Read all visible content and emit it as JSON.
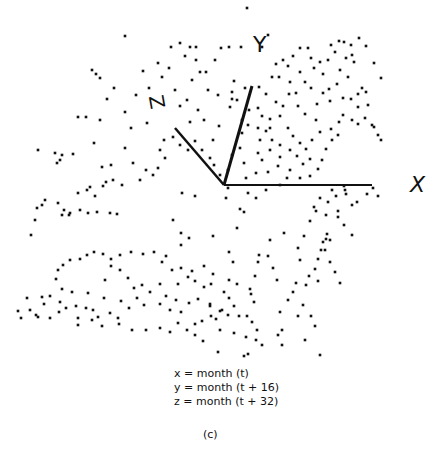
{
  "figure": {
    "axis_labels": {
      "x": "X",
      "y": "Y",
      "z": "Z"
    },
    "captions": [
      "x = month (t)",
      "y = month (t + 16)",
      "z = month (t + 32)"
    ],
    "sub_label": "(c)",
    "origin": [
      224,
      185
    ],
    "axes": {
      "x_end": [
        372,
        185
      ],
      "y_end": [
        252,
        86
      ],
      "z_end": [
        175,
        128
      ]
    }
  },
  "chart_data": {
    "type": "scatter",
    "title": "",
    "xlabel": "x = month (t)",
    "ylabel": "y = month (t + 16)",
    "zlabel": "z = month (t + 32)",
    "points_px": [
      [
        247,
        8
      ],
      [
        125,
        36
      ],
      [
        180,
        43
      ],
      [
        190,
        47
      ],
      [
        196,
        47
      ],
      [
        221,
        48
      ],
      [
        171,
        47
      ],
      [
        229,
        47
      ],
      [
        241,
        47
      ],
      [
        262,
        47
      ],
      [
        268,
        35
      ],
      [
        92,
        70
      ],
      [
        162,
        77
      ],
      [
        169,
        68
      ],
      [
        185,
        56
      ],
      [
        196,
        60
      ],
      [
        215,
        60
      ],
      [
        206,
        72
      ],
      [
        175,
        90
      ],
      [
        107,
        99
      ],
      [
        187,
        100
      ],
      [
        232,
        99
      ],
      [
        78,
        117
      ],
      [
        86,
        117
      ],
      [
        100,
        120
      ],
      [
        147,
        123
      ],
      [
        125,
        148
      ],
      [
        160,
        150
      ],
      [
        131,
        128
      ],
      [
        164,
        140
      ],
      [
        111,
        165
      ],
      [
        102,
        167
      ],
      [
        133,
        163
      ],
      [
        146,
        170
      ],
      [
        106,
        182
      ],
      [
        182,
        193
      ],
      [
        195,
        196
      ],
      [
        228,
        188
      ],
      [
        226,
        198
      ],
      [
        248,
        193
      ],
      [
        256,
        198
      ],
      [
        240,
        209
      ],
      [
        244,
        212
      ],
      [
        173,
        220
      ],
      [
        181,
        233
      ],
      [
        189,
        238
      ],
      [
        181,
        245
      ],
      [
        213,
        236
      ],
      [
        237,
        228
      ],
      [
        229,
        252
      ],
      [
        204,
        266
      ],
      [
        213,
        274
      ],
      [
        233,
        262
      ],
      [
        258,
        262
      ],
      [
        255,
        276
      ],
      [
        229,
        280
      ],
      [
        224,
        292
      ],
      [
        210,
        306
      ],
      [
        216,
        319
      ],
      [
        220,
        330
      ],
      [
        254,
        302
      ],
      [
        218,
        352
      ],
      [
        234,
        333
      ],
      [
        239,
        316
      ],
      [
        251,
        294
      ],
      [
        237,
        284
      ],
      [
        259,
        255
      ],
      [
        270,
        240
      ],
      [
        284,
        233
      ],
      [
        268,
        256
      ],
      [
        273,
        268
      ],
      [
        277,
        280
      ],
      [
        250,
        289
      ],
      [
        234,
        306
      ],
      [
        229,
        298
      ],
      [
        222,
        310
      ],
      [
        228,
        315
      ],
      [
        247,
        316
      ],
      [
        252,
        322
      ],
      [
        246,
        337
      ],
      [
        257,
        330
      ],
      [
        280,
        312
      ],
      [
        282,
        345
      ],
      [
        278,
        335
      ],
      [
        282,
        330
      ],
      [
        288,
        300
      ],
      [
        293,
        292
      ],
      [
        309,
        276
      ],
      [
        306,
        285
      ],
      [
        300,
        260
      ],
      [
        298,
        248
      ],
      [
        304,
        236
      ],
      [
        310,
        221
      ],
      [
        316,
        211
      ],
      [
        326,
        215
      ],
      [
        338,
        211
      ],
      [
        328,
        202
      ],
      [
        336,
        196
      ],
      [
        344,
        186
      ],
      [
        346,
        194
      ],
      [
        332,
        190
      ],
      [
        320,
        198
      ],
      [
        314,
        207
      ],
      [
        327,
        234
      ],
      [
        323,
        242
      ],
      [
        321,
        250
      ],
      [
        318,
        259
      ],
      [
        315,
        269
      ],
      [
        318,
        281
      ],
      [
        338,
        217
      ],
      [
        344,
        225
      ],
      [
        352,
        235
      ],
      [
        330,
        240
      ],
      [
        345,
        190
      ],
      [
        352,
        205
      ],
      [
        357,
        202
      ],
      [
        367,
        194
      ],
      [
        373,
        188
      ],
      [
        378,
        196
      ],
      [
        326,
        239
      ],
      [
        325,
        250
      ],
      [
        330,
        262
      ],
      [
        335,
        272
      ],
      [
        340,
        283
      ],
      [
        296,
        283
      ],
      [
        303,
        305
      ],
      [
        311,
        316
      ],
      [
        315,
        326
      ],
      [
        305,
        340
      ],
      [
        320,
        355
      ],
      [
        298,
        316
      ],
      [
        262,
        345
      ],
      [
        248,
        354
      ],
      [
        273,
        369
      ],
      [
        286,
        362
      ],
      [
        255,
        368
      ],
      [
        244,
        356
      ],
      [
        256,
        340
      ],
      [
        120,
        270
      ],
      [
        128,
        278
      ],
      [
        111,
        266
      ],
      [
        105,
        280
      ],
      [
        134,
        288
      ],
      [
        142,
        285
      ],
      [
        150,
        292
      ],
      [
        160,
        284
      ],
      [
        137,
        298
      ],
      [
        121,
        301
      ],
      [
        129,
        308
      ],
      [
        144,
        305
      ],
      [
        160,
        304
      ],
      [
        170,
        310
      ],
      [
        181,
        312
      ],
      [
        178,
        323
      ],
      [
        195,
        324
      ],
      [
        202,
        321
      ],
      [
        211,
        316
      ],
      [
        220,
        311
      ],
      [
        210,
        304
      ],
      [
        198,
        299
      ],
      [
        189,
        303
      ],
      [
        176,
        300
      ],
      [
        166,
        296
      ],
      [
        178,
        284
      ],
      [
        188,
        277
      ],
      [
        195,
        281
      ],
      [
        204,
        287
      ],
      [
        211,
        284
      ],
      [
        104,
        298
      ],
      [
        88,
        293
      ],
      [
        72,
        292
      ],
      [
        62,
        289
      ],
      [
        56,
        279
      ],
      [
        60,
        302
      ],
      [
        66,
        308
      ],
      [
        76,
        306
      ],
      [
        86,
        308
      ],
      [
        93,
        310
      ],
      [
        110,
        313
      ],
      [
        118,
        318
      ],
      [
        98,
        317
      ],
      [
        78,
        318
      ],
      [
        44,
        304
      ],
      [
        30,
        310
      ],
      [
        18,
        311
      ],
      [
        38,
        317
      ],
      [
        50,
        318
      ],
      [
        59,
        312
      ],
      [
        78,
        325
      ],
      [
        92,
        320
      ],
      [
        102,
        326
      ],
      [
        119,
        324
      ],
      [
        132,
        330
      ],
      [
        146,
        330
      ],
      [
        160,
        328
      ],
      [
        170,
        332
      ],
      [
        187,
        330
      ],
      [
        195,
        335
      ],
      [
        203,
        341
      ],
      [
        21,
        318
      ],
      [
        27,
        298
      ],
      [
        36,
        315
      ],
      [
        42,
        297
      ],
      [
        50,
        296
      ],
      [
        58,
        270
      ],
      [
        63,
        265
      ],
      [
        70,
        260
      ],
      [
        80,
        259
      ],
      [
        87,
        255
      ],
      [
        94,
        252
      ],
      [
        103,
        254
      ],
      [
        111,
        259
      ],
      [
        120,
        255
      ],
      [
        131,
        252
      ],
      [
        143,
        254
      ],
      [
        154,
        252
      ],
      [
        166,
        256
      ],
      [
        162,
        262
      ],
      [
        172,
        270
      ],
      [
        181,
        268
      ],
      [
        192,
        271
      ],
      [
        31,
        235
      ],
      [
        35,
        220
      ],
      [
        37,
        208
      ],
      [
        42,
        205
      ],
      [
        45,
        200
      ],
      [
        58,
        203
      ],
      [
        64,
        210
      ],
      [
        70,
        213
      ],
      [
        62,
        215
      ],
      [
        69,
        215
      ],
      [
        80,
        210
      ],
      [
        88,
        213
      ],
      [
        97,
        212
      ],
      [
        110,
        213
      ],
      [
        117,
        214
      ],
      [
        78,
        193
      ],
      [
        87,
        190
      ],
      [
        90,
        187
      ],
      [
        95,
        196
      ],
      [
        103,
        186
      ],
      [
        113,
        180
      ],
      [
        122,
        185
      ],
      [
        38,
        150
      ],
      [
        55,
        153
      ],
      [
        60,
        160
      ],
      [
        57,
        163
      ],
      [
        62,
        155
      ],
      [
        73,
        154
      ],
      [
        94,
        143
      ],
      [
        96,
        74
      ],
      [
        100,
        78
      ],
      [
        114,
        88
      ],
      [
        125,
        112
      ],
      [
        136,
        95
      ],
      [
        143,
        71
      ],
      [
        149,
        88
      ],
      [
        158,
        63
      ],
      [
        180,
        106
      ],
      [
        192,
        80
      ],
      [
        200,
        72
      ],
      [
        208,
        90
      ],
      [
        218,
        95
      ],
      [
        230,
        107
      ],
      [
        234,
        81
      ],
      [
        232,
        92
      ],
      [
        245,
        88
      ],
      [
        237,
        100
      ],
      [
        249,
        110
      ],
      [
        258,
        108
      ],
      [
        262,
        116
      ],
      [
        270,
        119
      ],
      [
        266,
        94
      ],
      [
        272,
        77
      ],
      [
        279,
        77
      ],
      [
        276,
        64
      ],
      [
        283,
        60
      ],
      [
        288,
        66
      ],
      [
        293,
        56
      ],
      [
        300,
        48
      ],
      [
        308,
        48
      ],
      [
        311,
        58
      ],
      [
        300,
        72
      ],
      [
        314,
        68
      ],
      [
        320,
        62
      ],
      [
        323,
        74
      ],
      [
        328,
        60
      ],
      [
        335,
        52
      ],
      [
        331,
        45
      ],
      [
        339,
        41
      ],
      [
        344,
        42
      ],
      [
        351,
        45
      ],
      [
        346,
        58
      ],
      [
        354,
        62
      ],
      [
        348,
        77
      ],
      [
        340,
        70
      ],
      [
        337,
        84
      ],
      [
        329,
        89
      ],
      [
        330,
        101
      ],
      [
        343,
        98
      ],
      [
        351,
        99
      ],
      [
        358,
        94
      ],
      [
        362,
        88
      ],
      [
        366,
        92
      ],
      [
        358,
        107
      ],
      [
        365,
        118
      ],
      [
        374,
        127
      ],
      [
        378,
        135
      ],
      [
        372,
        125
      ],
      [
        381,
        140
      ],
      [
        358,
        124
      ],
      [
        343,
        115
      ],
      [
        352,
        120
      ],
      [
        339,
        122
      ],
      [
        331,
        129
      ],
      [
        320,
        132
      ],
      [
        316,
        120
      ],
      [
        305,
        114
      ],
      [
        298,
        106
      ],
      [
        296,
        93
      ],
      [
        289,
        94
      ],
      [
        283,
        106
      ],
      [
        276,
        102
      ],
      [
        280,
        116
      ],
      [
        288,
        128
      ],
      [
        293,
        136
      ],
      [
        300,
        143
      ],
      [
        306,
        149
      ],
      [
        310,
        159
      ],
      [
        303,
        164
      ],
      [
        297,
        156
      ],
      [
        290,
        150
      ],
      [
        280,
        145
      ],
      [
        272,
        140
      ],
      [
        266,
        131
      ],
      [
        260,
        140
      ],
      [
        258,
        153
      ],
      [
        262,
        160
      ],
      [
        268,
        172
      ],
      [
        278,
        166
      ],
      [
        290,
        170
      ],
      [
        300,
        178
      ],
      [
        310,
        176
      ],
      [
        318,
        169
      ],
      [
        322,
        160
      ],
      [
        326,
        149
      ],
      [
        332,
        140
      ],
      [
        338,
        135
      ],
      [
        323,
        93
      ],
      [
        317,
        104
      ],
      [
        311,
        88
      ],
      [
        305,
        82
      ],
      [
        290,
        82
      ],
      [
        258,
        128
      ],
      [
        248,
        125
      ],
      [
        242,
        133
      ],
      [
        240,
        148
      ],
      [
        244,
        163
      ],
      [
        232,
        155
      ],
      [
        228,
        170
      ],
      [
        220,
        175
      ],
      [
        214,
        165
      ],
      [
        210,
        158
      ],
      [
        202,
        150
      ],
      [
        195,
        141
      ],
      [
        188,
        150
      ],
      [
        246,
        178
      ],
      [
        256,
        173
      ],
      [
        266,
        190
      ],
      [
        280,
        185
      ],
      [
        287,
        178
      ],
      [
        259,
        87
      ],
      [
        270,
        128
      ],
      [
        242,
        120
      ],
      [
        312,
        140
      ],
      [
        368,
        105
      ],
      [
        381,
        78
      ],
      [
        374,
        63
      ],
      [
        366,
        46
      ],
      [
        359,
        38
      ],
      [
        352,
        55
      ],
      [
        270,
        150
      ],
      [
        280,
        157
      ],
      [
        213,
        140
      ],
      [
        219,
        126
      ],
      [
        204,
        120
      ],
      [
        198,
        110
      ],
      [
        190,
        122
      ],
      [
        173,
        137
      ],
      [
        180,
        145
      ],
      [
        165,
        158
      ],
      [
        158,
        168
      ],
      [
        153,
        175
      ],
      [
        140,
        180
      ]
    ],
    "axis_vectors": {
      "x": [
        148,
        0
      ],
      "y": [
        28,
        -99
      ],
      "z": [
        -49,
        -57
      ]
    }
  }
}
